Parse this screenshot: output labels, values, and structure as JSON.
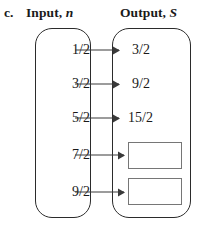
{
  "header": {
    "item_label": "c.",
    "input_title": "Input,",
    "input_variable": "n",
    "output_title": "Output,",
    "output_variable": "S"
  },
  "diagram": {
    "type": "mapping-diagram",
    "input_set_label": "Input, n",
    "output_set_label": "Output, S",
    "rows": [
      {
        "input": "1/2",
        "output": "3/2",
        "output_is_blank": false
      },
      {
        "input": "3/2",
        "output": "9/2",
        "output_is_blank": false
      },
      {
        "input": "5/2",
        "output": "15/2",
        "output_is_blank": false
      },
      {
        "input": "7/2",
        "output": "",
        "output_is_blank": true
      },
      {
        "input": "9/2",
        "output": "",
        "output_is_blank": true
      }
    ]
  },
  "colors": {
    "text": "#1a1a1a",
    "oval_stroke": "#2b2b2b",
    "arrow": "#3a3a3a",
    "answer_box_stroke": "#767676",
    "background": "#ffffff"
  }
}
